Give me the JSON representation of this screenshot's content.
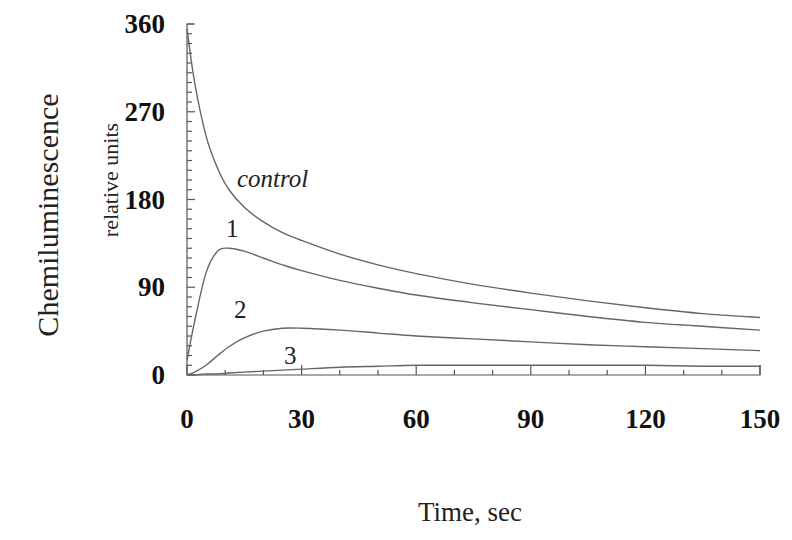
{
  "chart_data": {
    "type": "line",
    "title": "",
    "xlabel": "Time, sec",
    "ylabel": "Chemiluminescence",
    "ylabel_sub": "relative units",
    "xlim": [
      0,
      150
    ],
    "ylim": [
      0,
      360
    ],
    "x_ticks": [
      0,
      30,
      60,
      90,
      120,
      150
    ],
    "y_ticks": [
      0,
      90,
      180,
      270,
      360
    ],
    "grid": false,
    "legend": "inline labels",
    "x": [
      0,
      2,
      5,
      8,
      11,
      15,
      20,
      25,
      30,
      40,
      50,
      60,
      75,
      90,
      105,
      120,
      135,
      150
    ],
    "series": [
      {
        "name": "control",
        "values": [
          355,
          300,
          245,
          212,
          190,
          172,
          157,
          146,
          138,
          124,
          113,
          104,
          93,
          84,
          76,
          69,
          63,
          59
        ]
      },
      {
        "name": "1",
        "values": [
          15,
          55,
          105,
          127,
          130,
          127,
          120,
          113,
          107,
          97,
          89,
          82,
          74,
          67,
          60,
          54,
          50,
          46
        ]
      },
      {
        "name": "2",
        "values": [
          0,
          3,
          10,
          20,
          29,
          38,
          45,
          48,
          48,
          46,
          43,
          40,
          37,
          34,
          31,
          29,
          27,
          25
        ]
      },
      {
        "name": "3",
        "values": [
          0,
          0,
          1,
          1,
          2,
          3,
          4,
          5,
          6,
          8,
          9,
          10,
          10,
          10,
          10,
          10,
          9,
          9
        ]
      }
    ]
  },
  "labels": {
    "ylabel": "Chemiluminescence",
    "ylabel_sub": "relative units",
    "xlabel": "Time, sec",
    "control": "control",
    "c1": "1",
    "c2": "2",
    "c3": "3"
  }
}
